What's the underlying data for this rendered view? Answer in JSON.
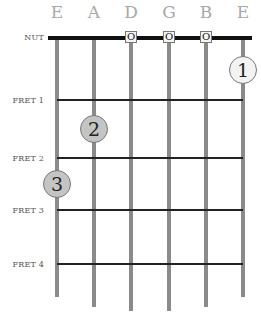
{
  "strings": [
    {
      "name": "E",
      "x": 57,
      "end": 297
    },
    {
      "name": "A",
      "x": 94,
      "end": 307
    },
    {
      "name": "D",
      "x": 131,
      "end": 311
    },
    {
      "name": "G",
      "x": 169,
      "end": 311
    },
    {
      "name": "B",
      "x": 206,
      "end": 307
    },
    {
      "name": "E",
      "x": 243,
      "end": 297
    }
  ],
  "labels": {
    "nut": "NUT",
    "fret1": "FRET 1",
    "fret2": "FRET 2",
    "fret3": "FRET 3",
    "fret4": "FRET 4"
  },
  "open_strings": [
    {
      "string": "D",
      "symbol": "O"
    },
    {
      "string": "G",
      "symbol": "O"
    },
    {
      "string": "B",
      "symbol": "O"
    }
  ],
  "fingers": [
    {
      "number": "1",
      "string": "E (high)",
      "fret": "open position"
    },
    {
      "number": "2",
      "string": "A",
      "fret": "2"
    },
    {
      "number": "3",
      "string": "E (low)",
      "fret": "3"
    }
  ]
}
